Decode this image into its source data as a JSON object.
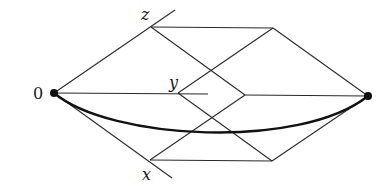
{
  "diagram": {
    "type": "cube-lattice-path",
    "labels": {
      "origin": "0",
      "z_axis": "z",
      "y_axis": "y",
      "x_axis": "x"
    },
    "colors": {
      "line": "#2a2a2a",
      "path": "#111111",
      "dot": "#111111"
    },
    "points": {
      "origin": [
        54,
        93
      ],
      "end": [
        368,
        96
      ],
      "z": [
        151,
        27
      ],
      "y": [
        178,
        93
      ],
      "x": [
        150,
        160
      ],
      "z_right": [
        273,
        28
      ],
      "x_right": [
        272,
        161
      ],
      "y_right": [
        245,
        95
      ]
    }
  }
}
